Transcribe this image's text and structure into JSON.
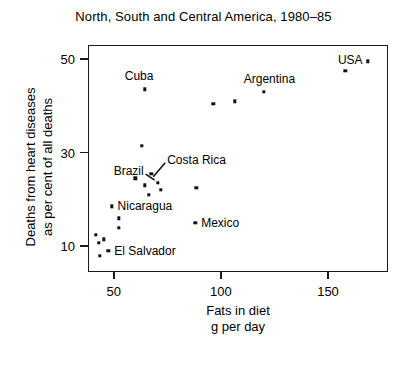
{
  "chart_data": {
    "type": "scatter",
    "title": "North, South and Central America, 1980–85",
    "xlabel_line1": "Fats in diet",
    "xlabel_line2": "g per day",
    "ylabel_line1": "Deaths from heart diseases",
    "ylabel_line2": "as per cent of all deaths",
    "xlim": [
      38,
      178
    ],
    "ylim": [
      4.5,
      53
    ],
    "xticks": [
      50,
      100,
      150
    ],
    "yticks": [
      10,
      30,
      50
    ],
    "grid": false,
    "legend": "none",
    "marker_color": "#111111",
    "axis_color": "#1a1a1a",
    "points": [
      {
        "label": "",
        "x": 41.5,
        "y": 12.5
      },
      {
        "label": "",
        "x": 43.0,
        "y": 10.8
      },
      {
        "label": "",
        "x": 43.5,
        "y": 8.0
      },
      {
        "label": "",
        "x": 45.5,
        "y": 11.5
      },
      {
        "label": "El Salvador",
        "x": 47.5,
        "y": 9.0,
        "label_pos": "right"
      },
      {
        "label": "Nicaragua",
        "x": 49.0,
        "y": 18.5,
        "label_pos": "right"
      },
      {
        "label": "",
        "x": 52.5,
        "y": 16.0
      },
      {
        "label": "",
        "x": 52.5,
        "y": 14.0
      },
      {
        "label": "Brazil",
        "x": 70.5,
        "y": 23.5,
        "label_pos": "leader-left"
      },
      {
        "label": "",
        "x": 66.5,
        "y": 21.0
      },
      {
        "label": "",
        "x": 60.0,
        "y": 24.5
      },
      {
        "label": "",
        "x": 63.0,
        "y": 31.5
      },
      {
        "label": "",
        "x": 64.5,
        "y": 23.0
      },
      {
        "label": "Costa Rica",
        "x": 67.5,
        "y": 25.5,
        "label_pos": "leader-right"
      },
      {
        "label": "",
        "x": 72.0,
        "y": 22.0
      },
      {
        "label": "Mexico",
        "x": 88.0,
        "y": 15.0,
        "label_pos": "right"
      },
      {
        "label": "",
        "x": 88.5,
        "y": 22.5
      },
      {
        "label": "Cuba",
        "x": 64.5,
        "y": 43.5,
        "label_pos": "above"
      },
      {
        "label": "Argentina",
        "x": 120.0,
        "y": 43.0,
        "label_pos": "above"
      },
      {
        "label": "",
        "x": 96.5,
        "y": 40.5
      },
      {
        "label": "",
        "x": 106.5,
        "y": 41.0
      },
      {
        "label": "",
        "x": 158.0,
        "y": 47.5
      },
      {
        "label": "USA",
        "x": 168.5,
        "y": 49.5,
        "label_pos": "left"
      }
    ]
  }
}
